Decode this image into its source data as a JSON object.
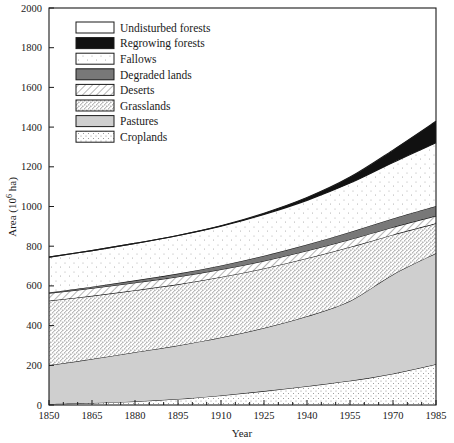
{
  "chart_data": {
    "type": "area",
    "title": "",
    "xlabel": "Year",
    "ylabel": "Area (10⁶ ha)",
    "ylabel_parts": {
      "base": "Area (10",
      "sup": "6",
      "tail": " ha)"
    },
    "xlim": [
      1850,
      1985
    ],
    "ylim": [
      0,
      2000
    ],
    "ytick_step": 200,
    "xtick_step": 15,
    "grid": false,
    "legend_position": "top-left-inside",
    "xticks": [
      "1850",
      "1865",
      "1880",
      "1895",
      "1910",
      "1925",
      "1940",
      "1955",
      "1970",
      "1985"
    ],
    "yticks": [
      "0",
      "200",
      "400",
      "600",
      "800",
      "1000",
      "1200",
      "1400",
      "1600",
      "1800",
      "2000"
    ],
    "x": [
      1850,
      1865,
      1880,
      1895,
      1910,
      1925,
      1940,
      1955,
      1970,
      1985
    ],
    "stack_order_bottom_to_top": [
      "Croplands",
      "Pastures",
      "Grasslands",
      "Deserts",
      "Degraded lands",
      "Fallows",
      "Regrowing forests",
      "Undisturbed forests"
    ],
    "series": [
      {
        "name": "Croplands",
        "fill": "#ffffff",
        "pattern": "croplands",
        "values": [
          5,
          10,
          18,
          30,
          48,
          70,
          95,
          122,
          158,
          205
        ]
      },
      {
        "name": "Pastures",
        "fill": "#cfcfcf",
        "pattern": "solid",
        "values": [
          195,
          222,
          248,
          270,
          292,
          318,
          352,
          402,
          500,
          560
        ]
      },
      {
        "name": "Grasslands",
        "fill": "#ffffff",
        "pattern": "grasslands",
        "values": [
          325,
          318,
          312,
          308,
          305,
          300,
          292,
          272,
          200,
          150
        ]
      },
      {
        "name": "Deserts",
        "fill": "#ffffff",
        "pattern": "deserts",
        "values": [
          38,
          38,
          38,
          38,
          38,
          38,
          38,
          38,
          38,
          38
        ]
      },
      {
        "name": "Degraded lands",
        "fill": "#787878",
        "pattern": "solid",
        "values": [
          4,
          8,
          12,
          16,
          20,
          26,
          32,
          38,
          44,
          50
        ]
      },
      {
        "name": "Fallows",
        "fill": "#ffffff",
        "pattern": "fallows",
        "values": [
          178,
          182,
          186,
          192,
          198,
          208,
          222,
          246,
          282,
          318
        ]
      },
      {
        "name": "Regrowing forests",
        "fill": "#111111",
        "pattern": "solid",
        "values": [
          0,
          0,
          0,
          0,
          2,
          6,
          14,
          30,
          62,
          108
        ]
      },
      {
        "name": "Undisturbed forests",
        "fill": "#ffffff",
        "pattern": "none",
        "values": [
          0,
          0,
          0,
          0,
          0,
          0,
          0,
          0,
          0,
          0
        ]
      }
    ],
    "stack_tops": {
      "croplands": [
        5,
        10,
        18,
        30,
        48,
        70,
        95,
        122,
        158,
        205
      ],
      "pastures": [
        200,
        232,
        266,
        300,
        340,
        388,
        447,
        524,
        658,
        765
      ],
      "grasslands": [
        525,
        550,
        578,
        608,
        645,
        688,
        739,
        796,
        858,
        915
      ],
      "deserts": [
        563,
        588,
        616,
        646,
        683,
        726,
        777,
        834,
        896,
        953
      ],
      "degraded": [
        567,
        596,
        628,
        662,
        703,
        752,
        809,
        872,
        940,
        1003
      ],
      "fallows": [
        745,
        778,
        814,
        854,
        901,
        960,
        1031,
        1118,
        1222,
        1321
      ],
      "regrowing": [
        745,
        778,
        814,
        854,
        903,
        966,
        1045,
        1148,
        1284,
        1429
      ]
    },
    "legend": [
      {
        "label": "Undisturbed forests",
        "swatch": "undisturbed-forests"
      },
      {
        "label": "Regrowing forests",
        "swatch": "regrowing-forests"
      },
      {
        "label": "Fallows",
        "swatch": "fallows"
      },
      {
        "label": "Degraded lands",
        "swatch": "degraded-lands"
      },
      {
        "label": "Deserts",
        "swatch": "deserts"
      },
      {
        "label": "Grasslands",
        "swatch": "grasslands"
      },
      {
        "label": "Pastures",
        "swatch": "pastures"
      },
      {
        "label": "Croplands",
        "swatch": "croplands"
      }
    ],
    "colors": {
      "axis": "#1a1a1a",
      "pastures": "#cfcfcf",
      "degraded_lands": "#787878",
      "regrowing_forests": "#111111",
      "background": "#ffffff"
    }
  }
}
